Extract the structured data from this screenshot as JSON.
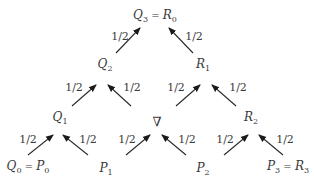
{
  "diagram": {
    "type": "binary-tree-weighted",
    "nodes": [
      {
        "id": "Q3R0",
        "main": "Q",
        "sub": "3",
        "eq": "=",
        "main2": "R",
        "sub2": "0"
      },
      {
        "id": "Q2",
        "main": "Q",
        "sub": "2"
      },
      {
        "id": "R1",
        "main": "R",
        "sub": "1"
      },
      {
        "id": "Q1",
        "main": "Q",
        "sub": "1"
      },
      {
        "id": "nabla",
        "main": "∇"
      },
      {
        "id": "R2",
        "main": "R",
        "sub": "2"
      },
      {
        "id": "Q0P0",
        "main": "Q",
        "sub": "0",
        "eq": "=",
        "main2": "P",
        "sub2": "0"
      },
      {
        "id": "P1",
        "main": "P",
        "sub": "1"
      },
      {
        "id": "P2",
        "main": "P",
        "sub": "2"
      },
      {
        "id": "P3R3",
        "main": "P",
        "sub": "3",
        "eq": "=",
        "main2": "R",
        "sub2": "3"
      }
    ],
    "edges": [
      {
        "from": "Q2",
        "to": "Q3R0",
        "weight": "1/2"
      },
      {
        "from": "R1",
        "to": "Q3R0",
        "weight": "1/2"
      },
      {
        "from": "Q1",
        "to": "Q2",
        "weight": "1/2"
      },
      {
        "from": "nabla",
        "to": "Q2",
        "weight": "1/2"
      },
      {
        "from": "nabla",
        "to": "R1",
        "weight": "1/2"
      },
      {
        "from": "R2",
        "to": "R1",
        "weight": "1/2"
      },
      {
        "from": "Q0P0",
        "to": "Q1",
        "weight": "1/2"
      },
      {
        "from": "P1",
        "to": "Q1",
        "weight": "1/2"
      },
      {
        "from": "P1",
        "to": "nabla",
        "weight": "1/2"
      },
      {
        "from": "P2",
        "to": "nabla",
        "weight": "1/2"
      },
      {
        "from": "P2",
        "to": "R2",
        "weight": "1/2"
      },
      {
        "from": "P3R3",
        "to": "R2",
        "weight": "1/2"
      }
    ]
  }
}
